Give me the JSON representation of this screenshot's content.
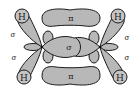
{
  "diagram": {
    "colors": {
      "lobe_fill": "#b8b8b8",
      "outline": "#1a1a1a",
      "background": "#ffffff",
      "hydrogen_fill": "#c4c4c4"
    },
    "labels": {
      "h_top_left": "H",
      "h_top_right": "H",
      "h_bottom_left": "H",
      "h_bottom_right": "H",
      "pi_top": "π",
      "pi_bottom": "π",
      "sigma_center": "σ",
      "sigma_left_top": "σ",
      "sigma_left_bottom": "σ",
      "sigma_right_top": "σ",
      "sigma_right_bottom": "σ"
    }
  }
}
